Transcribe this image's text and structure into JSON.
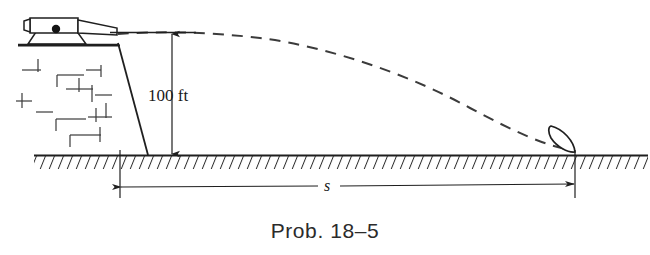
{
  "figure": {
    "caption": "Prob. 18–5",
    "height_label": "100 ft",
    "range_label": "s",
    "colors": {
      "ink": "#1f1f1f",
      "ink_soft": "#3b3b3b",
      "caption": "#2b2b2b",
      "background": "#ffffff"
    },
    "elements": {
      "cannon": "cannon-on-wall",
      "wall": "brick-wall-with-sloped-face",
      "ground": "hatched-ground-line",
      "trajectory": "dashed-parabolic-projectile-path",
      "projectile": "cannonball-impacting-ground",
      "vertical_dimension": "100 ft height of wall",
      "horizontal_dimension": "s horizontal range"
    }
  },
  "diagram_data": {
    "type": "physics-free-body-diagram",
    "description": "A cannon mounted on top of a 100 ft high brick wall fires a projectile that follows a dashed parabolic trajectory and lands on the ground at horizontal distance s from the base of the wall.",
    "known_quantity": {
      "name": "height",
      "value": 100,
      "unit": "ft",
      "label": "100 ft"
    },
    "unknown_quantity": {
      "name": "range",
      "symbol": "s",
      "unit": "ft"
    },
    "trajectory_points": [
      {
        "x": 118,
        "y": 34
      },
      {
        "x": 200,
        "y": 33
      },
      {
        "x": 300,
        "y": 42
      },
      {
        "x": 400,
        "y": 64
      },
      {
        "x": 480,
        "y": 92
      },
      {
        "x": 540,
        "y": 120
      },
      {
        "x": 572,
        "y": 148
      }
    ],
    "ground_y": 155,
    "wall_top_y": 46,
    "wall_left_x": 18,
    "wall_base_x": 148,
    "impact_x": 575
  }
}
